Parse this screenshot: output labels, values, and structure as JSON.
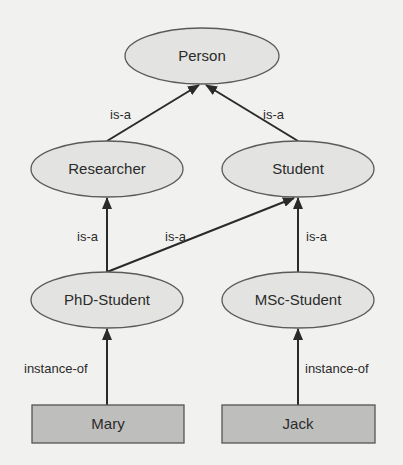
{
  "diagram": {
    "title": "",
    "colors": {
      "background": "#f1f1ef",
      "class_fill": "#e3e3e1",
      "class_stroke": "#5a5a5a",
      "instance_fill": "#bebebc",
      "instance_stroke": "#555555",
      "edge": "#2a2a2a",
      "text": "#2b2b2b"
    },
    "nodes": {
      "person": {
        "label": "Person",
        "type": "class"
      },
      "researcher": {
        "label": "Researcher",
        "type": "class"
      },
      "student": {
        "label": "Student",
        "type": "class"
      },
      "phd_student": {
        "label": "PhD-Student",
        "type": "class"
      },
      "msc_student": {
        "label": "MSc-Student",
        "type": "class"
      },
      "mary": {
        "label": "Mary",
        "type": "instance"
      },
      "jack": {
        "label": "Jack",
        "type": "instance"
      }
    },
    "edges": {
      "researcher_person": {
        "from": "Researcher",
        "to": "Person",
        "label": "is-a"
      },
      "student_person": {
        "from": "Student",
        "to": "Person",
        "label": "is-a"
      },
      "phd_researcher": {
        "from": "PhD-Student",
        "to": "Researcher",
        "label": "is-a"
      },
      "phd_student": {
        "from": "PhD-Student",
        "to": "Student",
        "label": "is-a"
      },
      "msc_student": {
        "from": "MSc-Student",
        "to": "Student",
        "label": "is-a"
      },
      "mary_phd": {
        "from": "Mary",
        "to": "PhD-Student",
        "label": "instance-of"
      },
      "jack_msc": {
        "from": "Jack",
        "to": "MSc-Student",
        "label": "instance-of"
      }
    }
  }
}
